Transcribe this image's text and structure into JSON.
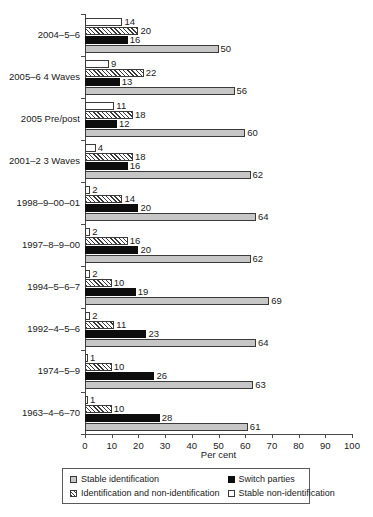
{
  "chart_data": {
    "type": "bar",
    "orientation": "horizontal",
    "title": "",
    "xlabel": "Per cent",
    "ylabel": "",
    "xlim": [
      0,
      100
    ],
    "xticks": [
      0,
      10,
      20,
      30,
      40,
      50,
      60,
      70,
      80,
      90,
      100
    ],
    "grid": false,
    "legend_position": "bottom",
    "categories": [
      "2004–5–6",
      "2005–6 4 Waves",
      "2005 Pre/post",
      "2001–2 3 Waves",
      "1998–9–00–01",
      "1997–8–9–00",
      "1994–5–6–7",
      "1992–4–5–6",
      "1974–5–9",
      "1963–4–6–70"
    ],
    "series": [
      {
        "name": "Stable non-identification",
        "swatch": "sw-white",
        "color": "#ffffff",
        "values": [
          14,
          9,
          11,
          4,
          2,
          2,
          2,
          2,
          1,
          1
        ]
      },
      {
        "name": "Identification and non-identification",
        "swatch": "sw-hatch",
        "color": "#ffffff",
        "values": [
          20,
          22,
          18,
          18,
          14,
          16,
          10,
          11,
          10,
          10
        ]
      },
      {
        "name": "Switch parties",
        "swatch": "sw-black",
        "color": "#0d0d0d",
        "values": [
          16,
          13,
          12,
          16,
          20,
          20,
          19,
          23,
          26,
          28
        ]
      },
      {
        "name": "Stable identification",
        "swatch": "sw-grey",
        "color": "#c6c6c6",
        "values": [
          50,
          56,
          60,
          62,
          64,
          62,
          69,
          64,
          63,
          61
        ]
      }
    ]
  },
  "legend": {
    "entries": [
      {
        "label": "Stable identification",
        "swatch": "sw-grey"
      },
      {
        "label": "Switch parties",
        "swatch": "sw-black"
      },
      {
        "label": "Identification and non-identification",
        "swatch": "sw-hatch"
      },
      {
        "label": "Stable non-identification",
        "swatch": "sw-white"
      }
    ]
  }
}
